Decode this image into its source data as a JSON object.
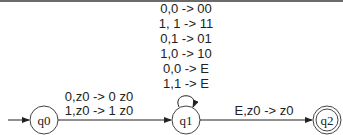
{
  "diagram": {
    "type": "pushdown-automaton",
    "states": [
      {
        "id": "q0",
        "label": "q0",
        "initial": true,
        "accepting": false
      },
      {
        "id": "q1",
        "label": "q1",
        "initial": false,
        "accepting": false
      },
      {
        "id": "q2",
        "label": "q2",
        "initial": false,
        "accepting": true
      }
    ],
    "transitions": [
      {
        "from": "q0",
        "to": "q1",
        "labels": [
          "0,z0 -> 0 z0",
          "1,z0 -> 1 z0"
        ]
      },
      {
        "from": "q1",
        "to": "q1",
        "labels": [
          "0,0 -> 00",
          "1, 1 -> 11",
          "0,1 -> 01",
          "1,0 -> 10",
          "0,0 -> E",
          "1,1 -> E"
        ]
      },
      {
        "from": "q1",
        "to": "q2",
        "labels": [
          "E,z0 -> z0"
        ]
      }
    ]
  }
}
